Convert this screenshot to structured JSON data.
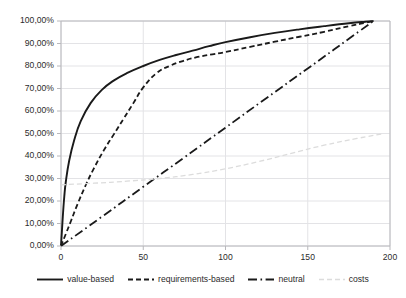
{
  "chart_data": {
    "type": "line",
    "title": "",
    "subtitle": "",
    "xlabel": "",
    "ylabel": "",
    "xlim": [
      0,
      200
    ],
    "ylim": [
      0,
      1.0
    ],
    "grid": true,
    "legend_position": "bottom",
    "x_ticks": [
      "0",
      "50",
      "100",
      "150",
      "200"
    ],
    "x_tick_values": [
      0,
      50,
      100,
      150,
      200
    ],
    "y_ticks": [
      "0,00%",
      "10,00%",
      "20,00%",
      "30,00%",
      "40,00%",
      "50,00%",
      "60,00%",
      "70,00%",
      "80,00%",
      "90,00%",
      "100,00%"
    ],
    "y_tick_values": [
      0,
      0.1,
      0.2,
      0.3,
      0.4,
      0.5,
      0.6,
      0.7,
      0.8,
      0.9,
      1.0
    ],
    "series": [
      {
        "name": "value-based",
        "style": "solid",
        "color": "#1a1a1a",
        "x": [
          0,
          1,
          2,
          3,
          5,
          8,
          12,
          18,
          25,
          32,
          40,
          50,
          60,
          70,
          80,
          90,
          100,
          115,
          130,
          145,
          160,
          175,
          185,
          190
        ],
        "values": [
          0.0,
          0.12,
          0.22,
          0.29,
          0.38,
          0.47,
          0.555,
          0.635,
          0.695,
          0.735,
          0.768,
          0.8,
          0.827,
          0.849,
          0.868,
          0.888,
          0.906,
          0.928,
          0.947,
          0.963,
          0.977,
          0.99,
          0.997,
          1.0
        ]
      },
      {
        "name": "requirements-based",
        "style": "dashed",
        "color": "#1a1a1a",
        "x": [
          0,
          3,
          6,
          10,
          15,
          20,
          26,
          32,
          38,
          44,
          50,
          58,
          66,
          74,
          82,
          92,
          100,
          115,
          130,
          145,
          160,
          175,
          185,
          190
        ],
        "values": [
          0.0,
          0.055,
          0.11,
          0.185,
          0.27,
          0.345,
          0.425,
          0.495,
          0.565,
          0.635,
          0.705,
          0.768,
          0.8,
          0.822,
          0.838,
          0.852,
          0.862,
          0.885,
          0.908,
          0.93,
          0.952,
          0.977,
          0.992,
          1.0
        ]
      },
      {
        "name": "neutral",
        "style": "dashdot",
        "color": "#1a1a1a",
        "x": [
          0,
          25,
          50,
          75,
          100,
          125,
          150,
          175,
          190
        ],
        "values": [
          0.0,
          0.131,
          0.263,
          0.394,
          0.526,
          0.658,
          0.789,
          0.921,
          1.0
        ]
      },
      {
        "name": "costs",
        "style": "dashed",
        "color": "#dcdcdc",
        "x": [
          0,
          20,
          40,
          60,
          80,
          100,
          120,
          140,
          160,
          180,
          195
        ],
        "values": [
          0.272,
          0.279,
          0.288,
          0.3,
          0.318,
          0.343,
          0.375,
          0.412,
          0.448,
          0.478,
          0.498
        ]
      }
    ]
  },
  "legend": {
    "items": [
      {
        "label": "value-based"
      },
      {
        "label": "requirements-based"
      },
      {
        "label": "neutral"
      },
      {
        "label": "costs"
      }
    ]
  },
  "colors": {
    "line": "#1a1a1a",
    "costs_line": "#dcdcdc",
    "grid": "#e3e3e6",
    "axis": "#b8b8bc",
    "text": "#2b2b2b",
    "background": "#ffffff"
  }
}
